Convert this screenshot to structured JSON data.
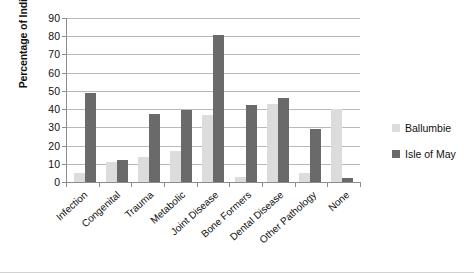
{
  "chart_data": {
    "type": "bar",
    "title": "",
    "xlabel": "",
    "ylabel": "Percentage of Individuals",
    "ylim": [
      0,
      90
    ],
    "ytick_step": 10,
    "yticks": [
      0,
      10,
      20,
      30,
      40,
      50,
      60,
      70,
      80,
      90
    ],
    "grid": true,
    "legend_position": "right",
    "categories": [
      "Infection",
      "Congenital",
      "Trauma",
      "Metabolic",
      "Joint Disease",
      "Bone Formers",
      "Dental Disease",
      "Other Pathology",
      "None"
    ],
    "series": [
      {
        "name": "Ballumbie",
        "color": "#dcdcdc",
        "values": [
          5,
          11,
          14,
          17,
          37,
          3,
          43,
          5,
          40
        ]
      },
      {
        "name": "Isle of May",
        "color": "#6a6a6a",
        "values": [
          49,
          12,
          37.5,
          39.5,
          80.5,
          42,
          46,
          29,
          2
        ]
      }
    ]
  },
  "axis": {
    "y_title": "Percentage of Individuals"
  },
  "legend": {
    "items": [
      {
        "label": "Ballumbie"
      },
      {
        "label": "Isle of May"
      }
    ]
  }
}
